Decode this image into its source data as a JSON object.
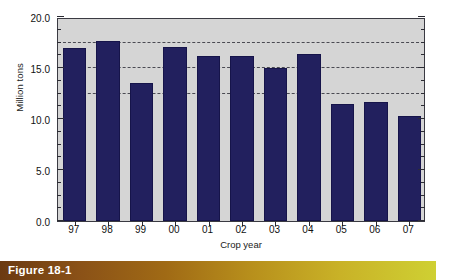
{
  "chart_data": {
    "type": "bar",
    "title": "",
    "xlabel": "Crop year",
    "ylabel": "Million tons",
    "categories": [
      "97",
      "98",
      "99",
      "00",
      "01",
      "02",
      "03",
      "04",
      "05",
      "06",
      "07"
    ],
    "values": [
      17.0,
      17.6,
      13.5,
      17.1,
      16.2,
      16.2,
      15.0,
      16.4,
      11.5,
      11.7,
      10.3
    ],
    "ylim": [
      0.0,
      20.0
    ],
    "y_tick_labels": [
      "0.0",
      "5.0",
      "10.0",
      "15.0",
      "20.0"
    ],
    "y_tick_values": [
      0.0,
      5.0,
      10.0,
      15.0,
      20.0
    ],
    "y_minor_tick_values": [
      1.25,
      2.5,
      3.75,
      6.25,
      7.5,
      8.75,
      11.25,
      12.5,
      13.75,
      16.25,
      17.5,
      18.75
    ],
    "gridlines": [
      12.5,
      15.0,
      17.5
    ],
    "grid": true,
    "legend": "none",
    "bar_color": "#22205e",
    "plot_background": "#d5d5d5",
    "axis_color": "#3a3a42",
    "gridline_color": "#4a4a52"
  },
  "caption": {
    "label": "Figure 18-1",
    "gradient_start": "#6b3a12",
    "gradient_end": "#cfd033",
    "text_color": "#ffffff"
  }
}
